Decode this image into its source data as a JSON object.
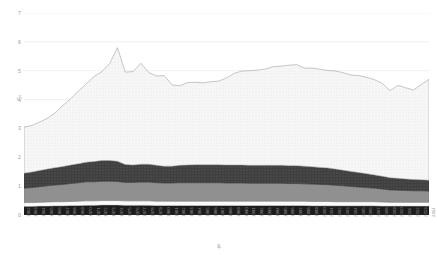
{
  "chart_data": {
    "type": "area",
    "stacked": true,
    "title": "",
    "subtitle": "",
    "xlabel": "年",
    "ylabel": "万t",
    "xlim": [
      1962,
      2014
    ],
    "ylim": [
      0,
      7
    ],
    "ytick_values": [
      0,
      1,
      2,
      3,
      4,
      5,
      6,
      7
    ],
    "ytick_labels": [
      "0",
      "1",
      "2",
      "3",
      "4",
      "5",
      "6",
      "7"
    ],
    "grid": true,
    "grid_axis": "y",
    "legend": "none",
    "legend_position": "none",
    "x": [
      1962,
      1963,
      1964,
      1965,
      1966,
      1967,
      1968,
      1969,
      1970,
      1971,
      1972,
      1973,
      1974,
      1975,
      1976,
      1977,
      1978,
      1979,
      1980,
      1981,
      1982,
      1983,
      1984,
      1985,
      1986,
      1987,
      1988,
      1989,
      1990,
      1991,
      1992,
      1993,
      1994,
      1995,
      1996,
      1997,
      1998,
      1999,
      2000,
      2001,
      2002,
      2003,
      2004,
      2005,
      2006,
      2007,
      2008,
      2009,
      2010,
      2011,
      2012,
      2013,
      2014
    ],
    "xtick_labels": [
      "1962",
      "1963",
      "1964",
      "1965",
      "1966",
      "1967",
      "1968",
      "1969",
      "1970",
      "1971",
      "1972",
      "1973",
      "1974",
      "1975",
      "1976",
      "1977",
      "1978",
      "1979",
      "1980",
      "1981",
      "1982",
      "1983",
      "1984",
      "1985",
      "1986",
      "1987",
      "1988",
      "1989",
      "1990",
      "1991",
      "1992",
      "1993",
      "1994",
      "1995",
      "1996",
      "1997",
      "1998",
      "1999",
      "2000",
      "2001",
      "2002",
      "2003",
      "2004",
      "2005",
      "2006",
      "2007",
      "2008",
      "2009",
      "2010",
      "2011",
      "2012",
      "2013",
      "2014"
    ],
    "series": [
      {
        "name": "layer-1",
        "color": "#1c1c1c",
        "values": [
          0.3,
          0.3,
          0.31,
          0.31,
          0.32,
          0.32,
          0.33,
          0.33,
          0.34,
          0.34,
          0.35,
          0.35,
          0.35,
          0.34,
          0.34,
          0.34,
          0.34,
          0.33,
          0.33,
          0.33,
          0.33,
          0.33,
          0.33,
          0.33,
          0.33,
          0.33,
          0.33,
          0.33,
          0.33,
          0.33,
          0.33,
          0.33,
          0.33,
          0.33,
          0.33,
          0.33,
          0.33,
          0.32,
          0.32,
          0.32,
          0.32,
          0.32,
          0.32,
          0.32,
          0.32,
          0.32,
          0.31,
          0.31,
          0.31,
          0.31,
          0.31,
          0.31,
          0.31
        ]
      },
      {
        "name": "layer-2",
        "color": "#fbfbfb",
        "values": [
          0.13,
          0.13,
          0.13,
          0.14,
          0.14,
          0.14,
          0.14,
          0.15,
          0.15,
          0.15,
          0.15,
          0.15,
          0.15,
          0.15,
          0.15,
          0.15,
          0.15,
          0.15,
          0.15,
          0.15,
          0.15,
          0.15,
          0.15,
          0.15,
          0.15,
          0.15,
          0.15,
          0.15,
          0.15,
          0.15,
          0.15,
          0.15,
          0.15,
          0.15,
          0.15,
          0.15,
          0.15,
          0.15,
          0.15,
          0.15,
          0.14,
          0.14,
          0.14,
          0.14,
          0.14,
          0.14,
          0.14,
          0.13,
          0.13,
          0.13,
          0.13,
          0.13,
          0.13
        ]
      },
      {
        "name": "layer-3",
        "color": "#8f8f8f",
        "values": [
          0.5,
          0.52,
          0.54,
          0.56,
          0.58,
          0.6,
          0.62,
          0.64,
          0.66,
          0.66,
          0.67,
          0.67,
          0.66,
          0.64,
          0.64,
          0.65,
          0.65,
          0.64,
          0.63,
          0.63,
          0.64,
          0.64,
          0.64,
          0.64,
          0.64,
          0.64,
          0.63,
          0.63,
          0.63,
          0.62,
          0.62,
          0.62,
          0.62,
          0.62,
          0.61,
          0.61,
          0.6,
          0.6,
          0.59,
          0.58,
          0.57,
          0.55,
          0.53,
          0.51,
          0.49,
          0.47,
          0.45,
          0.43,
          0.42,
          0.41,
          0.4,
          0.4,
          0.39
        ]
      },
      {
        "name": "layer-4",
        "color": "#3d3d3d",
        "values": [
          0.52,
          0.54,
          0.56,
          0.58,
          0.6,
          0.62,
          0.64,
          0.66,
          0.68,
          0.7,
          0.72,
          0.72,
          0.7,
          0.62,
          0.6,
          0.62,
          0.62,
          0.6,
          0.58,
          0.58,
          0.6,
          0.61,
          0.62,
          0.62,
          0.62,
          0.62,
          0.62,
          0.62,
          0.62,
          0.62,
          0.62,
          0.62,
          0.62,
          0.62,
          0.62,
          0.62,
          0.61,
          0.6,
          0.59,
          0.58,
          0.56,
          0.54,
          0.52,
          0.5,
          0.48,
          0.46,
          0.44,
          0.42,
          0.41,
          0.4,
          0.39,
          0.38,
          0.37
        ]
      },
      {
        "name": "layer-5",
        "color": "#f4f4f4",
        "values": [
          1.6,
          1.61,
          1.68,
          1.76,
          1.9,
          2.12,
          2.3,
          2.52,
          2.72,
          2.95,
          3.08,
          3.36,
          3.94,
          3.2,
          3.24,
          3.5,
          3.18,
          3.1,
          3.14,
          2.82,
          2.76,
          2.86,
          2.86,
          2.84,
          2.88,
          2.9,
          3.02,
          3.18,
          3.26,
          3.28,
          3.3,
          3.34,
          3.42,
          3.44,
          3.48,
          3.5,
          3.4,
          3.42,
          3.4,
          3.38,
          3.4,
          3.38,
          3.34,
          3.36,
          3.34,
          3.3,
          3.22,
          3.02,
          3.22,
          3.16,
          3.1,
          3.3,
          3.5
        ]
      }
    ]
  }
}
